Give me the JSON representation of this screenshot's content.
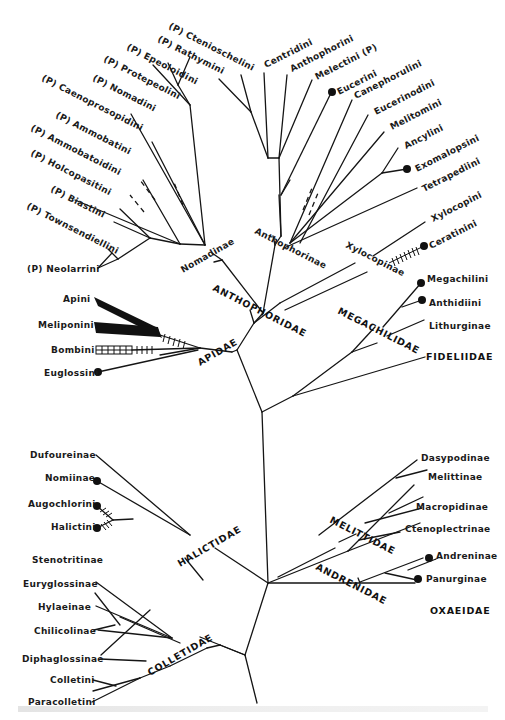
{
  "figure": {
    "parasitic_marker": "(P)",
    "families": [
      "ANTHOPHORIDAE",
      "APIDAE",
      "MEGACHILIDAE",
      "FIDELIIDAE",
      "HALICTIDAE",
      "MELITTIDAE",
      "ANDRENIDAE",
      "OXAEIDAE",
      "COLLETIDAE"
    ],
    "subfamily_groups": [
      "Nomadinae",
      "Anthophorinae",
      "Xylocopinae"
    ],
    "nomadinae": [
      "(P) Ctenioschelini",
      "(P) Rathymini",
      "(P) Epeoloidini",
      "(P) Protepeolini",
      "(P) Nomadini",
      "(P) Caenoprosopidini",
      "(P) Ammobatini",
      "(P) Ammobatoidini",
      "(P) Holcopasitini",
      "(P) Biastini",
      "(P) Townsendiellini",
      "(P) Neolarrini"
    ],
    "anthophorinae": [
      "Centridini",
      "Anthophorini",
      "Melectini (P)",
      "Eucerini",
      "Canephorulini",
      "Eucerinodini",
      "Melitomini",
      "Ancylini",
      "Exomalopsini",
      "Tetrapediini"
    ],
    "xylocopinae": [
      "Xylocopini",
      "Ceratinini"
    ],
    "apidae": [
      "Apini",
      "Meliponini",
      "Bombini",
      "Euglossini"
    ],
    "megachilidae": [
      "Megachilini",
      "Anthidiini",
      "Lithurginae"
    ],
    "halictidae": [
      "Dufoureinae",
      "Nomiinae",
      "Augochlorini",
      "Halictini"
    ],
    "melittidae": [
      "Dasypodinae",
      "Melittinae",
      "Macropidinae",
      "Ctenoplectrinae"
    ],
    "andrenidae": [
      "Andreninae",
      "Panurginae"
    ],
    "colletidae": [
      "Stenotritinae",
      "Euryglossinae",
      "Hylaeinae",
      "Chilicolinae",
      "Diphaglossinae",
      "Colletini",
      "Paracolletini"
    ],
    "legend": {
      "dot": "eusocial / social terminal marker",
      "hatch": "social behavior bars",
      "dashed": "uncertain branch"
    }
  }
}
